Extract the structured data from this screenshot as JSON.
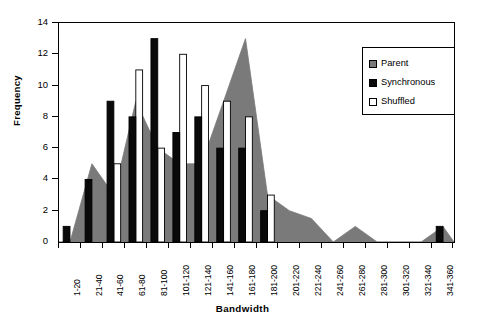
{
  "chart_data": {
    "type": "bar",
    "title": "",
    "xlabel": "Bandwidth",
    "ylabel": "Frequency",
    "ylim": [
      0,
      14
    ],
    "ytick_values": [
      0,
      2,
      4,
      6,
      8,
      10,
      12,
      14
    ],
    "ytick_labels": [
      "0",
      "2",
      "4",
      "6",
      "8",
      "10",
      "12",
      "14"
    ],
    "grid": false,
    "legend_position": "top-right",
    "categories": [
      "1-20",
      "21-40",
      "41-60",
      "61-80",
      "81-100",
      "101-120",
      "121-140",
      "141-160",
      "161-180",
      "181-200",
      "201-220",
      "221-240",
      "241-260",
      "261-280",
      "281-300",
      "301-320",
      "321-340",
      "341-360"
    ],
    "series": [
      {
        "name": "Parent",
        "render": "area",
        "color": "#7a7a7a",
        "values": [
          0,
          5,
          3,
          9,
          6,
          5,
          5,
          9,
          13,
          3,
          2,
          1.5,
          0,
          1,
          0,
          0,
          0,
          1
        ]
      },
      {
        "name": "Synchronous",
        "render": "bar",
        "color": "#0a0a0a",
        "values": [
          1,
          4,
          9,
          8,
          13,
          7,
          8,
          6,
          6,
          2,
          0,
          0,
          0,
          0,
          0,
          0,
          0,
          1
        ]
      },
      {
        "name": "Shuffled",
        "render": "bar",
        "color": "#ffffff",
        "values": [
          0,
          0,
          5,
          11,
          6,
          12,
          10,
          9,
          8,
          3,
          0,
          0,
          0,
          0,
          0,
          0,
          0,
          0
        ]
      }
    ]
  },
  "legend": {
    "entries": [
      {
        "label": "Parent",
        "swatch": "gray-swatch"
      },
      {
        "label": "Synchronous",
        "swatch": "black-swatch"
      },
      {
        "label": "Shuffled",
        "swatch": "white-swatch"
      }
    ]
  },
  "axes": {
    "y_title": "Frequency",
    "x_title": "Bandwidth"
  }
}
